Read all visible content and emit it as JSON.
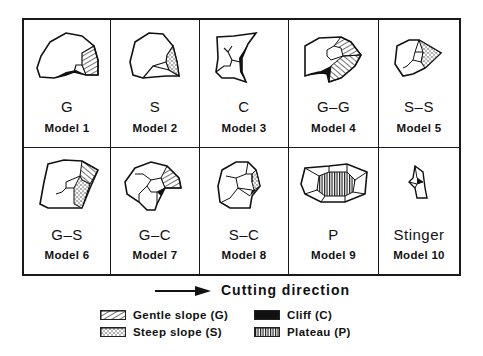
{
  "models": [
    {
      "code": "G",
      "label": "Model 1"
    },
    {
      "code": "S",
      "label": "Model 2"
    },
    {
      "code": "C",
      "label": "Model 3"
    },
    {
      "code": "G–G",
      "label": "Model 4"
    },
    {
      "code": "S–S",
      "label": "Model  5"
    },
    {
      "code": "G–S",
      "label": "Model 6"
    },
    {
      "code": "G–C",
      "label": "Model 7"
    },
    {
      "code": "S–C",
      "label": "Model 8"
    },
    {
      "code": "P",
      "label": "Model 9"
    },
    {
      "code": "Stinger",
      "label": "Model 10"
    }
  ],
  "direction": {
    "label": "Cutting  direction",
    "icon": "right-arrow-icon"
  },
  "legend": [
    {
      "label": "Gentle slope (G)",
      "pattern": "diagonal-hatch"
    },
    {
      "label": "Cliff (C)",
      "pattern": "solid-black"
    },
    {
      "label": "Steep slope (S)",
      "pattern": "stipple"
    },
    {
      "label": "Plateau (P)",
      "pattern": "vertical-hatch"
    }
  ],
  "colors": {
    "ink": "#1a1a1a",
    "paper": "#ffffff"
  }
}
